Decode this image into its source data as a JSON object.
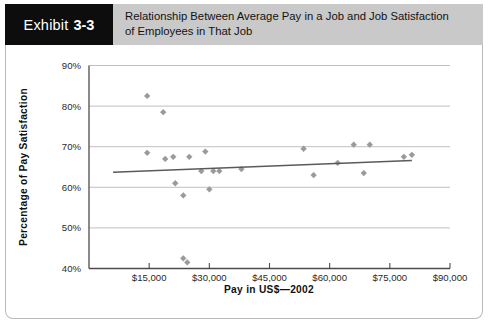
{
  "header": {
    "exhibit_word": "Exhibit",
    "exhibit_number": "3-3",
    "title_line1": "Relationship Between Average Pay in a Job and Job Satisfaction",
    "title_line2": "of Employees in That Job",
    "tab_bg": "#0d0d0d",
    "title_bg": "#c9c9c9"
  },
  "chart_data": {
    "type": "scatter",
    "title": "Relationship Between Average Pay in a Job and Job Satisfaction of Employees in That Job",
    "xlabel": "Pay in US$—2002",
    "ylabel": "Percentage of Pay Satisfaction",
    "xlim": [
      0,
      90000
    ],
    "ylim": [
      40,
      90
    ],
    "xticks": [
      15000,
      30000,
      45000,
      60000,
      75000,
      90000
    ],
    "xticklabels": [
      "$15,000",
      "$30,000",
      "$45,000",
      "$60,000",
      "$75,000",
      "$90,000"
    ],
    "yticks": [
      40,
      50,
      60,
      70,
      80,
      90
    ],
    "yticklabels": [
      "40%",
      "50%",
      "60%",
      "70%",
      "80%",
      "90%"
    ],
    "grid": "horizontal",
    "legend": "none",
    "marker_color": "#9a9a9a",
    "trendline_color": "#5a5a5a",
    "points": [
      {
        "x": 14500,
        "y": 68.5
      },
      {
        "x": 14500,
        "y": 82.5
      },
      {
        "x": 18500,
        "y": 78.5
      },
      {
        "x": 19000,
        "y": 67.0
      },
      {
        "x": 21000,
        "y": 67.5
      },
      {
        "x": 21500,
        "y": 61.0
      },
      {
        "x": 23500,
        "y": 58.0
      },
      {
        "x": 25000,
        "y": 67.5
      },
      {
        "x": 23500,
        "y": 42.5
      },
      {
        "x": 24500,
        "y": 41.5
      },
      {
        "x": 28000,
        "y": 64.0
      },
      {
        "x": 29000,
        "y": 68.8
      },
      {
        "x": 31000,
        "y": 64.0
      },
      {
        "x": 32500,
        "y": 64.0
      },
      {
        "x": 30000,
        "y": 59.5
      },
      {
        "x": 38000,
        "y": 64.5
      },
      {
        "x": 53500,
        "y": 69.5
      },
      {
        "x": 56000,
        "y": 63.0
      },
      {
        "x": 62000,
        "y": 66.0
      },
      {
        "x": 66000,
        "y": 70.5
      },
      {
        "x": 70000,
        "y": 70.5
      },
      {
        "x": 68500,
        "y": 63.5
      },
      {
        "x": 78500,
        "y": 67.5
      },
      {
        "x": 80500,
        "y": 68.0
      }
    ],
    "trendline": {
      "x1": 6000,
      "y1": 63.7,
      "x2": 80500,
      "y2": 66.6
    }
  }
}
